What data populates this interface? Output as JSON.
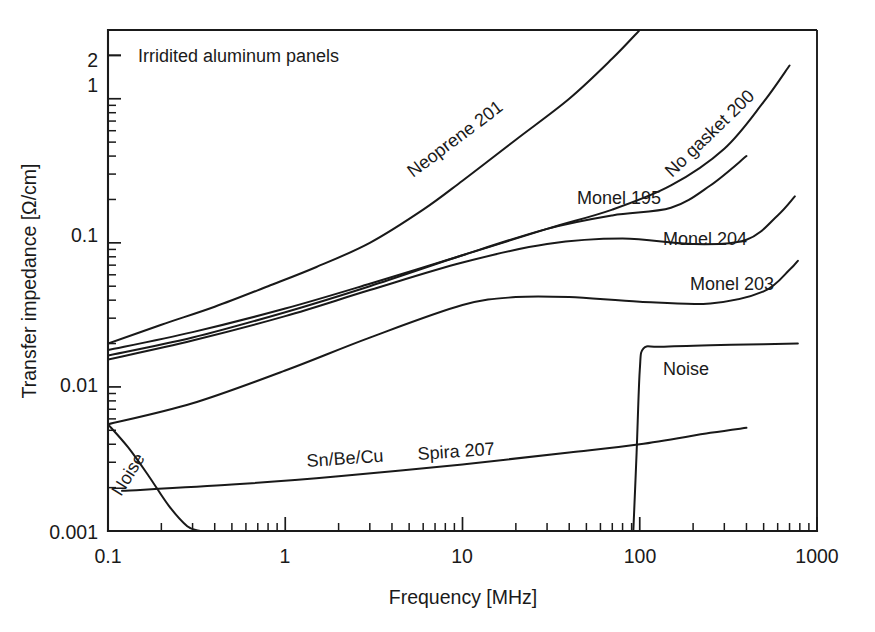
{
  "chart_data": {
    "type": "line",
    "title": "Irridited aluminum panels",
    "subtitle": "",
    "xlabel": "Frequency  [MHz]",
    "ylabel": "Transfer impedance  [Ω/cm]",
    "xscale": "log",
    "yscale": "log",
    "xlim": [
      0.1,
      1000
    ],
    "ylim": [
      0.001,
      3.0
    ],
    "grid": false,
    "legend_position": "inline-annotations",
    "xticks": [
      0.1,
      1,
      10,
      100,
      1000
    ],
    "xtick_labels": [
      "0.1",
      "1",
      "10",
      "100",
      "1000"
    ],
    "yticks": [
      0.001,
      0.01,
      0.1,
      1,
      2
    ],
    "ytick_labels": [
      "0.001",
      "0.01",
      "0.1",
      "1",
      "2"
    ],
    "series": [
      {
        "name": "Neoprene 201",
        "label": "Neoprene 201",
        "label_rotation_deg": -37,
        "x": [
          0.1,
          0.2,
          0.4,
          0.8,
          1.5,
          3,
          6,
          10,
          20,
          40,
          70,
          100
        ],
        "y": [
          0.02,
          0.027,
          0.036,
          0.05,
          0.068,
          0.1,
          0.17,
          0.27,
          0.52,
          1.0,
          1.9,
          3.0
        ]
      },
      {
        "name": "No gasket 200",
        "label": "No gasket 200",
        "label_rotation_deg": -44,
        "x": [
          0.1,
          0.3,
          1,
          3,
          10,
          30,
          70,
          150,
          300,
          500,
          700
        ],
        "y": [
          0.018,
          0.024,
          0.035,
          0.052,
          0.082,
          0.125,
          0.17,
          0.25,
          0.45,
          0.95,
          1.7
        ]
      },
      {
        "name": "Monel 195",
        "label": "Monel 195",
        "label_rotation_deg": 0,
        "x": [
          0.1,
          0.3,
          1,
          3,
          10,
          30,
          70,
          150,
          250,
          400
        ],
        "y": [
          0.0165,
          0.022,
          0.033,
          0.05,
          0.082,
          0.125,
          0.155,
          0.175,
          0.25,
          0.4
        ]
      },
      {
        "name": "Monel 204",
        "label": "Monel 204",
        "label_rotation_deg": 0,
        "x": [
          0.1,
          0.3,
          1,
          3,
          10,
          30,
          80,
          200,
          400,
          600,
          750
        ],
        "y": [
          0.0155,
          0.021,
          0.031,
          0.047,
          0.073,
          0.098,
          0.107,
          0.098,
          0.105,
          0.155,
          0.21
        ]
      },
      {
        "name": "Monel 203",
        "label": "Monel 203",
        "label_rotation_deg": 0,
        "x": [
          0.1,
          0.3,
          1,
          3,
          10,
          20,
          40,
          100,
          250,
          500,
          700,
          780
        ],
        "y": [
          0.0055,
          0.0077,
          0.013,
          0.022,
          0.037,
          0.042,
          0.042,
          0.039,
          0.038,
          0.046,
          0.065,
          0.075
        ]
      },
      {
        "name": "Sn/Be/Cu Spira 207",
        "label": "Sn/Be/Cu    Spira 207",
        "label_rotation_deg": -4,
        "x": [
          0.12,
          0.5,
          2,
          10,
          40,
          100,
          250,
          400
        ],
        "y": [
          0.0019,
          0.0021,
          0.0024,
          0.0029,
          0.0035,
          0.004,
          0.0048,
          0.0052
        ]
      },
      {
        "name": "Noise (low frequency)",
        "label": "Noise",
        "label_rotation_deg": -58,
        "x": [
          0.1,
          0.13,
          0.17,
          0.22,
          0.28,
          0.33
        ],
        "y": [
          0.0055,
          0.0038,
          0.0024,
          0.0015,
          0.00108,
          0.001
        ]
      },
      {
        "name": "Noise (high frequency)",
        "label": "Noise",
        "label_rotation_deg": 0,
        "x": [
          92,
          96,
          100,
          105,
          130,
          250,
          500,
          780
        ],
        "y": [
          0.001,
          0.0035,
          0.013,
          0.0185,
          0.019,
          0.0195,
          0.0198,
          0.02
        ]
      }
    ],
    "annotations": [
      {
        "text": "Irridited aluminum panels",
        "x_px": 138,
        "y_px": 62,
        "rotation": 0
      },
      {
        "text": "Neoprene 201",
        "x_px": 413,
        "y_px": 178,
        "rotation": -37
      },
      {
        "text": "No gasket 200",
        "x_px": 672,
        "y_px": 178,
        "rotation": -44
      },
      {
        "text": "Monel 195",
        "x_px": 577,
        "y_px": 204,
        "rotation": 0
      },
      {
        "text": "Monel 204",
        "x_px": 663,
        "y_px": 245,
        "rotation": 0
      },
      {
        "text": "Monel 203",
        "x_px": 690,
        "y_px": 290,
        "rotation": 0
      },
      {
        "text": "Sn/Be/Cu",
        "x_px": 307,
        "y_px": 467,
        "rotation": -4
      },
      {
        "text": "Spira 207",
        "x_px": 418,
        "y_px": 460,
        "rotation": -4
      },
      {
        "text": "Noise",
        "x_px": 121,
        "y_px": 497,
        "rotation": -58
      },
      {
        "text": "Noise",
        "x_px": 663,
        "y_px": 375,
        "rotation": 0
      }
    ]
  },
  "axes": {
    "y_title": "Transfer impedance  [Ω/cm]",
    "x_title": "Frequency  [MHz]",
    "y_labels": [
      "2",
      "1",
      "0.1",
      "0.01",
      "0.001"
    ],
    "x_labels": [
      "0.1",
      "1",
      "10",
      "100",
      "1000"
    ]
  },
  "colors": {
    "ink": "#1a1a1a",
    "background": "#ffffff",
    "curve": "#191919"
  }
}
